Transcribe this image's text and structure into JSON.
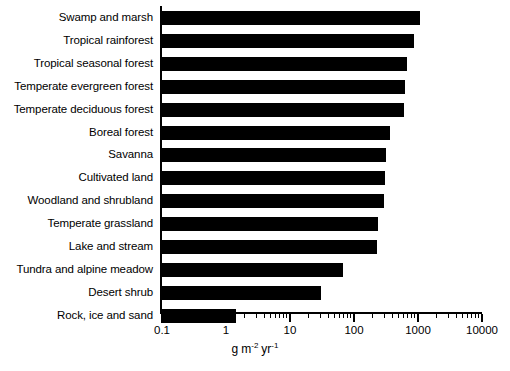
{
  "chart_data": {
    "type": "bar",
    "orientation": "horizontal",
    "title": "",
    "xlabel": "g m-2 yr-1",
    "xlabel_parts": {
      "g": "g",
      "m": "m",
      "m_exp": "-2",
      "yr": "yr",
      "yr_exp": "-1"
    },
    "ylabel": "",
    "xscale": "log",
    "xlim": [
      0.1,
      10000
    ],
    "grid": false,
    "legend": false,
    "bar_color": "#000000",
    "background_color": "#ffffff",
    "xticks": [
      0.1,
      1,
      10,
      100,
      1000,
      10000
    ],
    "xticklabels": [
      "0.1",
      "1",
      "10",
      "100",
      "1000",
      "10000"
    ],
    "categories": [
      "Swamp and marsh",
      "Tropical rainforest",
      "Tropical seasonal forest",
      "Temperate evergreen forest",
      "Temperate deciduous forest",
      "Boreal forest",
      "Savanna",
      "Cultivated land",
      "Woodland and shrubland",
      "Temperate grassland",
      "Lake and stream",
      "Tundra and alpine meadow",
      "Desert shrub",
      "Rock, ice and sand"
    ],
    "values": [
      1100,
      900,
      700,
      650,
      620,
      380,
      330,
      320,
      300,
      250,
      240,
      70,
      32,
      1.5
    ]
  }
}
